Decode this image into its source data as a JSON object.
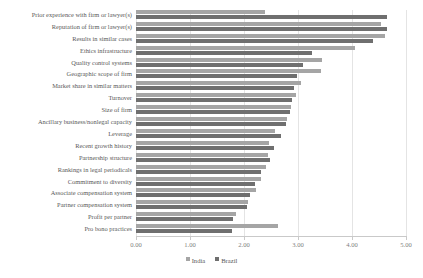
{
  "chart_data": {
    "type": "bar",
    "orientation": "horizontal",
    "title": "",
    "xlabel": "",
    "ylabel": "",
    "xlim": [
      0.0,
      5.0
    ],
    "xticks": [
      "0.00",
      "1.00",
      "2.00",
      "3.00",
      "4.00",
      "5.00"
    ],
    "grid": true,
    "legend_position": "bottom",
    "categories": [
      "Prior experience with firm or lawyer(s)",
      "Reputation of firm or lawyer(s)",
      "Results in similar cases",
      "Ethics infrastructure",
      "Quality control systems",
      "Geographic scope of firm",
      "Market share in similar matters",
      "Turnover",
      "Size of firm",
      "Ancillary business/nonlegal capacity",
      "Leverage",
      "Recent growth history",
      "Partnership structure",
      "Rankings in legal periodicals",
      "Commitment to diversity",
      "Associate compensation system",
      "Partner compensation system",
      "Profit per partner",
      "Pro bono practices"
    ],
    "series": [
      {
        "name": "India",
        "color": "#a5a5a5",
        "values": [
          2.39,
          4.53,
          4.61,
          4.06,
          3.44,
          3.42,
          3.05,
          2.96,
          2.87,
          2.8,
          2.57,
          2.47,
          2.44,
          2.4,
          2.32,
          2.22,
          2.08,
          1.85,
          2.63
        ]
      },
      {
        "name": "Brazil",
        "color": "#6f6f6f",
        "values": [
          4.65,
          4.64,
          4.39,
          3.26,
          3.09,
          2.98,
          2.92,
          2.88,
          2.85,
          2.78,
          2.69,
          2.55,
          2.48,
          2.32,
          2.2,
          2.12,
          2.05,
          1.8,
          1.78
        ]
      }
    ]
  },
  "legend": {
    "items": [
      {
        "label": "India",
        "color": "#a5a5a5"
      },
      {
        "label": "Brazil",
        "color": "#6f6f6f"
      }
    ]
  }
}
